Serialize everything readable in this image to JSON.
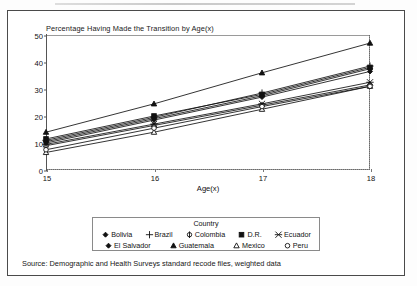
{
  "chart_data": {
    "type": "line",
    "title": "Percentage Having Made the Transition by Age(x)",
    "xlabel": "Age(x)",
    "ylabel": "",
    "x": [
      15,
      16,
      17,
      18
    ],
    "xlim": [
      15,
      18
    ],
    "ylim": [
      0,
      50
    ],
    "xticks": [
      "15",
      "16",
      "17",
      "18"
    ],
    "yticks": [
      "0",
      "10",
      "20",
      "30",
      "40",
      "50"
    ],
    "grid": false,
    "legend_position": "bottom",
    "legend_title": "Country",
    "series": [
      {
        "name": "Bolivia",
        "marker": "diamond-filled",
        "values": [
          10.5,
          19.0,
          27.5,
          37.5
        ]
      },
      {
        "name": "Brazil",
        "marker": "plus",
        "values": [
          11.0,
          19.5,
          28.5,
          38.5
        ]
      },
      {
        "name": "Colombia",
        "marker": "circle-cross",
        "values": [
          9.0,
          16.5,
          24.0,
          31.5
        ]
      },
      {
        "name": "D.R.",
        "marker": "square-filled",
        "values": [
          11.5,
          20.0,
          28.0,
          38.0
        ]
      },
      {
        "name": "Ecuador",
        "marker": "x-cross",
        "values": [
          9.5,
          17.0,
          24.5,
          32.5
        ]
      },
      {
        "name": "El Salvador",
        "marker": "diamond-filled",
        "values": [
          10.0,
          18.5,
          27.0,
          36.5
        ]
      },
      {
        "name": "Guatemala",
        "marker": "triangle-filled",
        "values": [
          14.0,
          24.5,
          36.0,
          47.0
        ]
      },
      {
        "name": "Mexico",
        "marker": "triangle-open",
        "values": [
          6.5,
          14.0,
          22.5,
          31.0
        ]
      },
      {
        "name": "Peru",
        "marker": "circle-open",
        "values": [
          7.5,
          15.5,
          23.5,
          31.0
        ]
      }
    ]
  },
  "source_note": "Source: Demographic and Health Surveys standard recode files, weighted data"
}
